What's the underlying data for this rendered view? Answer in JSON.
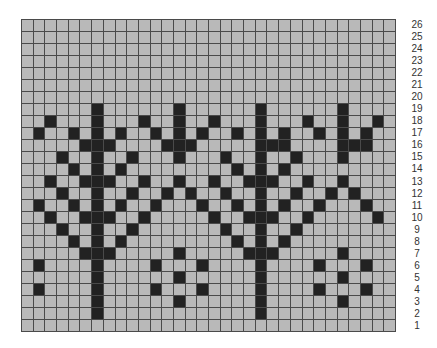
{
  "chart_data": {
    "type": "heatmap",
    "title": "",
    "columns": 32,
    "rows": 26,
    "row_labels": [
      "26",
      "25",
      "24",
      "23",
      "22",
      "21",
      "20",
      "19",
      "18",
      "17",
      "16",
      "15",
      "14",
      "13",
      "12",
      "11",
      "10",
      "9",
      "8",
      "7",
      "6",
      "5",
      "4",
      "3",
      "2",
      "1"
    ],
    "colors": {
      "background_cell": "#b9b9b9",
      "filled_cell": "#222222",
      "grid_line": "#4a4a4a"
    },
    "grid": [
      "00000000000000000000000000000000",
      "00000000000000000000000000000000",
      "00000000000000000000000000000000",
      "00000000000000000000000000000000",
      "00000000000000000000000000000000",
      "00000000000000000000000000000000",
      "00000000000000000000000000000000",
      "00000010000001000000100000010000",
      "00100010001001001000100010010010",
      "01001010100101010010101001010100",
      "00000111000011100000111000011100",
      "00010010010001000100100100010000",
      "00001010100000000010101000000000",
      "00100111001001001001110010010000",
      "00010010010010100100100100101000",
      "01001010100100010010101001000100",
      "00100111001000001001110010000010",
      "00010010010000000100100100000000",
      "00001010100000000010101000000000",
      "00000111000001000001110000010000",
      "01000010000100010000100001000100",
      "00000010000001000000100000010000",
      "01000010000100010000100001000100",
      "00000010000001000000100000010000",
      "00000010000000000000100000000000",
      "00000000000000000000000000000000"
    ]
  }
}
